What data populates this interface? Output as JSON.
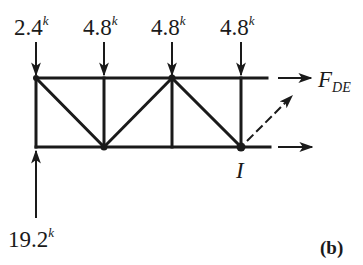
{
  "figure": {
    "panel_label": "(b)"
  },
  "loads": [
    {
      "value": "2.4",
      "unit": "k",
      "direction": "down",
      "x": 36
    },
    {
      "value": "4.8",
      "unit": "k",
      "direction": "down",
      "x": 104
    },
    {
      "value": "4.8",
      "unit": "k",
      "direction": "down",
      "x": 172
    },
    {
      "value": "4.8",
      "unit": "k",
      "direction": "down",
      "x": 241
    }
  ],
  "reaction": {
    "value": "19.2",
    "unit": "k",
    "direction": "up",
    "x": 36
  },
  "member_forces": {
    "top": {
      "label": "F",
      "subscript": "DE"
    },
    "diagonal": {
      "label": ""
    },
    "bottom": {
      "label": ""
    }
  },
  "joint_label": "I",
  "colors": {
    "ink": "#1a1a1a",
    "background": "#ffffff"
  }
}
